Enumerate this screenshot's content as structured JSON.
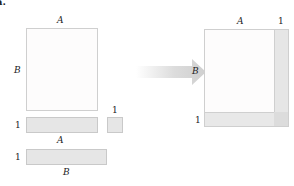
{
  "panel_label": "a.",
  "left": {
    "main_box": {
      "top_label": "A",
      "side_label": "B"
    },
    "row_vector": {
      "side_label": "1",
      "bottom_label": "A"
    },
    "scalar_box": {
      "top_label": "1"
    },
    "col_vector": {
      "side_label": "1",
      "bottom_label": "B"
    }
  },
  "arrow": {
    "direction": "right"
  },
  "right": {
    "top_label_main": "A",
    "top_label_extra": "1",
    "side_label_main": "B",
    "side_label_extra": "1"
  },
  "colors": {
    "white_fill": "#fdfcfc",
    "gray_fill": "#e6e6e6",
    "border": "#cfcfcf",
    "arrow": "#d0d0d0"
  }
}
